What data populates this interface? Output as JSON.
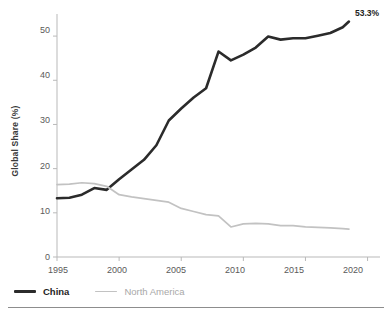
{
  "chart_data": {
    "type": "line",
    "title": "",
    "xlabel": "",
    "ylabel": "Global Share (%)",
    "xlim": [
      1995,
      2021
    ],
    "ylim": [
      0,
      55
    ],
    "grid": false,
    "legend_position": "bottom-left",
    "xticks": [
      "1995",
      "2000",
      "2005",
      "2010",
      "2015",
      "2020"
    ],
    "yticks": [
      "0",
      "10",
      "20",
      "30",
      "40",
      "50"
    ],
    "x": [
      1995,
      1996,
      1997,
      1998,
      1999,
      2000,
      2001,
      2002,
      2003,
      2004,
      2005,
      2006,
      2007,
      2008,
      2009,
      2010,
      2011,
      2012,
      2013,
      2014,
      2015,
      2016,
      2017,
      2018,
      2018.5
    ],
    "series": [
      {
        "name": "China",
        "color": "#2b2b2b",
        "values": [
          13.3,
          13.4,
          14.1,
          15.6,
          15.2,
          17.6,
          19.8,
          22.0,
          25.3,
          30.9,
          33.6,
          36.1,
          38.2,
          46.5,
          44.5,
          45.8,
          47.4,
          49.9,
          49.2,
          49.5,
          49.5,
          50.1,
          50.7,
          52.0,
          53.3
        ],
        "end_label": "53.3%"
      },
      {
        "name": "North America",
        "color": "#c2c2c2",
        "values": [
          16.4,
          16.5,
          16.8,
          16.6,
          16.0,
          14.1,
          13.6,
          13.2,
          12.8,
          12.4,
          11.0,
          10.3,
          9.6,
          9.3,
          6.8,
          7.5,
          7.6,
          7.5,
          7.1,
          7.1,
          6.8,
          6.7,
          6.6,
          6.4,
          6.3
        ],
        "end_label": ""
      }
    ],
    "annotations": [
      {
        "text": "53.3%",
        "series": "China",
        "x": 2018.5,
        "y": 53.3
      }
    ]
  },
  "legend": {
    "items": [
      {
        "label": "China",
        "swatch": "china-line-swatch"
      },
      {
        "label": "North America",
        "swatch": "north-america-line-swatch"
      }
    ]
  },
  "axes": {
    "y_title": "Global Share (%)",
    "y_ticks": [
      "50",
      "40",
      "30",
      "20",
      "10",
      "0"
    ],
    "x_ticks": [
      "1995",
      "2000",
      "2005",
      "2010",
      "2015",
      "2020"
    ]
  }
}
